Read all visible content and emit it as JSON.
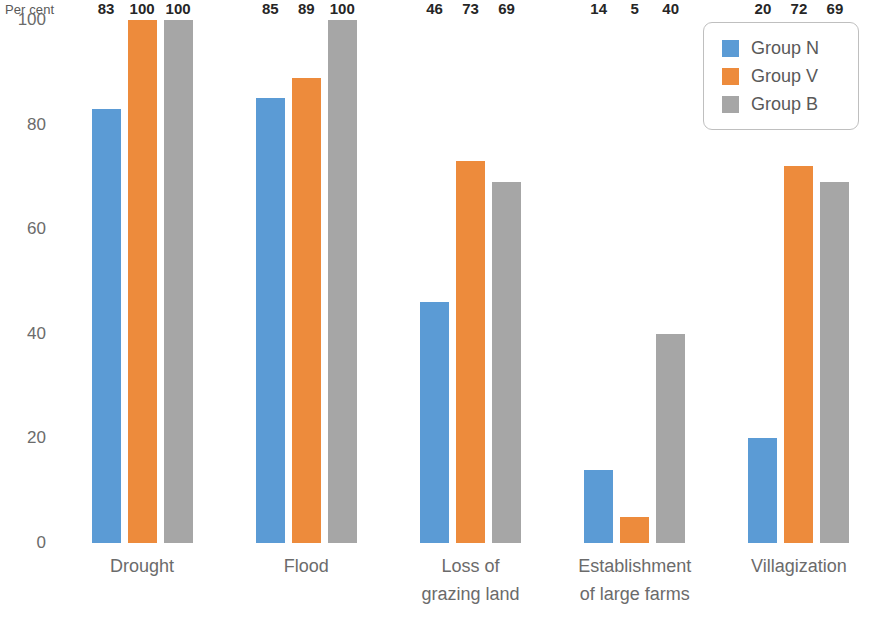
{
  "chart_data": {
    "type": "bar",
    "title": "",
    "subtitle": "",
    "xlabel": "",
    "ylabel": "Per cent",
    "ylim": [
      0,
      100
    ],
    "ytick_step": 20,
    "yticks": [
      0,
      20,
      40,
      60,
      80,
      100
    ],
    "ytick_labels": [
      "0",
      "20",
      "40",
      "60",
      "80",
      "100"
    ],
    "grid": false,
    "legend_position": "top-right",
    "categories": [
      "Drought",
      "Flood",
      "Loss of grazing land",
      "Establishment of large farms",
      "Villagization"
    ],
    "category_label_lines": [
      [
        "Drought"
      ],
      [
        "Flood"
      ],
      [
        "Loss of",
        "grazing land"
      ],
      [
        "Establishment",
        "of large farms"
      ],
      [
        "Villagization"
      ]
    ],
    "series": [
      {
        "name": "Group N",
        "color": "#5b9bd5",
        "values": [
          83,
          85,
          46,
          14,
          20
        ]
      },
      {
        "name": "Group V",
        "color": "#ed8b3c",
        "values": [
          100,
          89,
          73,
          5,
          72
        ]
      },
      {
        "name": "Group B",
        "color": "#a6a6a6",
        "values": [
          100,
          100,
          69,
          40,
          69
        ]
      }
    ],
    "value_labels": [
      [
        "83",
        "100",
        "100"
      ],
      [
        "85",
        "89",
        "100"
      ],
      [
        "46",
        "73",
        "69"
      ],
      [
        "14",
        "5",
        "40"
      ],
      [
        "20",
        "72",
        "69"
      ]
    ]
  },
  "legend": {
    "items": [
      {
        "label": "Group N",
        "color": "#5b9bd5"
      },
      {
        "label": "Group V",
        "color": "#ed8b3c"
      },
      {
        "label": "Group B",
        "color": "#a6a6a6"
      }
    ]
  }
}
